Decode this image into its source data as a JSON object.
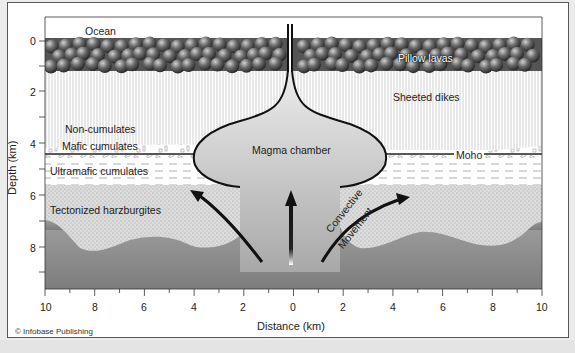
{
  "diagram": {
    "layers": [
      {
        "name": "ocean",
        "label": "Ocean"
      },
      {
        "name": "pillow-lavas",
        "label": "Pillow lavas"
      },
      {
        "name": "sheeted-dikes",
        "label": "Sheeted dikes"
      },
      {
        "name": "non-cumulates",
        "label": "Non-cumulates"
      },
      {
        "name": "mafic-cumulates",
        "label": "Mafic cumulates"
      },
      {
        "name": "ultramafic-cumulates",
        "label": "Ultramafic cumulates"
      },
      {
        "name": "tectonized-harzburgites",
        "label": "Tectonized harzburgites"
      }
    ],
    "features": {
      "magma_chamber": "Magma chamber",
      "moho": "Moho",
      "convective_1": "Convective",
      "convective_2": "Movement"
    },
    "y_axis": {
      "label": "Depth (km)",
      "ticks": [
        "0",
        "2",
        "4",
        "6",
        "8"
      ]
    },
    "x_axis": {
      "label": "Distance (km)",
      "ticks": [
        "10",
        "8",
        "6",
        "4",
        "2",
        "0",
        "2",
        "4",
        "6",
        "8",
        "10"
      ]
    },
    "credit": "© Infobase Publishing",
    "colors": {
      "pillow": "#5a5a5a",
      "mantle": "#8a8a8a",
      "harzburgite": "#d8d8d8",
      "chamber_top": "#e8e8e8",
      "chamber_bottom": "#9a9a9a",
      "outline": "#1a1a1a"
    }
  }
}
